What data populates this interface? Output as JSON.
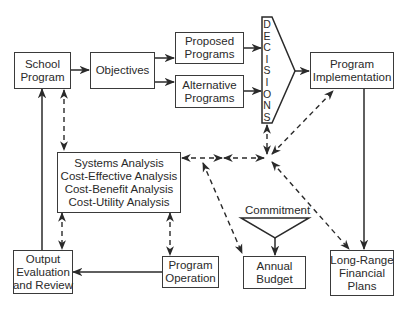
{
  "diagram": {
    "nodes": {
      "school_program": [
        "School",
        "Program"
      ],
      "objectives": [
        "Objectives"
      ],
      "proposed_programs": [
        "Proposed",
        "Programs"
      ],
      "alternative_programs": [
        "Alternative",
        "Programs"
      ],
      "decisions": [
        "D",
        "E",
        "C",
        "I",
        "S",
        "I",
        "O",
        "N",
        "S"
      ],
      "program_implementation": [
        "Program",
        "Implementation"
      ],
      "analysis": [
        "Systems Analysis",
        "Cost-Effective Analysis",
        "Cost-Benefit Analysis",
        "Cost-Utility Analysis"
      ],
      "output_evaluation": [
        "Output",
        "Evaluation",
        "and Review"
      ],
      "program_operation": [
        "Program",
        "Operation"
      ],
      "commitment": "Commitment",
      "annual_budget": [
        "Annual",
        "Budget"
      ],
      "long_range_plans": [
        "Long-Range",
        "Financial",
        "Plans"
      ]
    },
    "edges": [
      {
        "from": "School Program",
        "to": "Objectives",
        "style": "solid"
      },
      {
        "from": "Objectives",
        "to": "Proposed Programs",
        "style": "solid"
      },
      {
        "from": "Objectives",
        "to": "Alternative Programs",
        "style": "solid"
      },
      {
        "from": "Proposed Programs",
        "to": "DECISIONS",
        "style": "solid"
      },
      {
        "from": "Alternative Programs",
        "to": "DECISIONS",
        "style": "solid"
      },
      {
        "from": "DECISIONS",
        "to": "Program Implementation",
        "style": "solid"
      },
      {
        "from": "Program Implementation",
        "to": "Long-Range Financial Plans",
        "style": "solid"
      },
      {
        "from": "Program Operation",
        "to": "Output Evaluation and Review",
        "style": "solid"
      },
      {
        "from": "Output Evaluation and Review",
        "to": "School Program",
        "style": "solid"
      },
      {
        "from": "Commitment",
        "to": "Annual Budget",
        "style": "solid"
      },
      {
        "from": "School Program",
        "to": "Systems Analysis",
        "style": "dashed",
        "bidirectional": true
      },
      {
        "from": "Systems Analysis",
        "to": "Output Evaluation and Review",
        "style": "dashed",
        "bidirectional": true
      },
      {
        "from": "Systems Analysis",
        "to": "Program Operation",
        "style": "dashed",
        "bidirectional": true
      },
      {
        "from": "Systems Analysis",
        "to": "Hub",
        "style": "dashed",
        "bidirectional": true
      },
      {
        "from": "Hub",
        "to": "DECISIONS",
        "style": "dashed",
        "bidirectional": true
      },
      {
        "from": "Hub",
        "to": "Program Implementation",
        "style": "dashed",
        "bidirectional": true
      },
      {
        "from": "Hub",
        "to": "Long-Range Financial Plans",
        "style": "dashed",
        "bidirectional": true
      },
      {
        "from": "Hub",
        "to": "Annual Budget",
        "style": "dashed",
        "bidirectional": true
      }
    ]
  }
}
